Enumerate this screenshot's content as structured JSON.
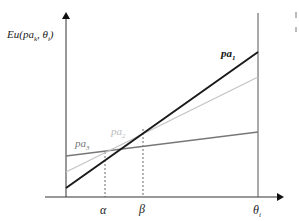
{
  "diagram": {
    "y_axis_label": "Eu(pa",
    "y_axis_label_sub": "k",
    "y_axis_label_tail": ", θ",
    "y_axis_label_sub2": "i",
    "y_axis_label_end": ")",
    "x_axis_end_label": "θ",
    "x_axis_end_label_sub": "i",
    "tick_alpha": "α",
    "tick_beta": "β",
    "lines": [
      {
        "name": "pa",
        "sub": "1",
        "color": "#1a1a1a",
        "width": 2
      },
      {
        "name": "pa",
        "sub": "2",
        "color": "#c0c0c0",
        "width": 1.3
      },
      {
        "name": "pa",
        "sub": "3",
        "color": "#777777",
        "width": 1.3
      }
    ]
  }
}
